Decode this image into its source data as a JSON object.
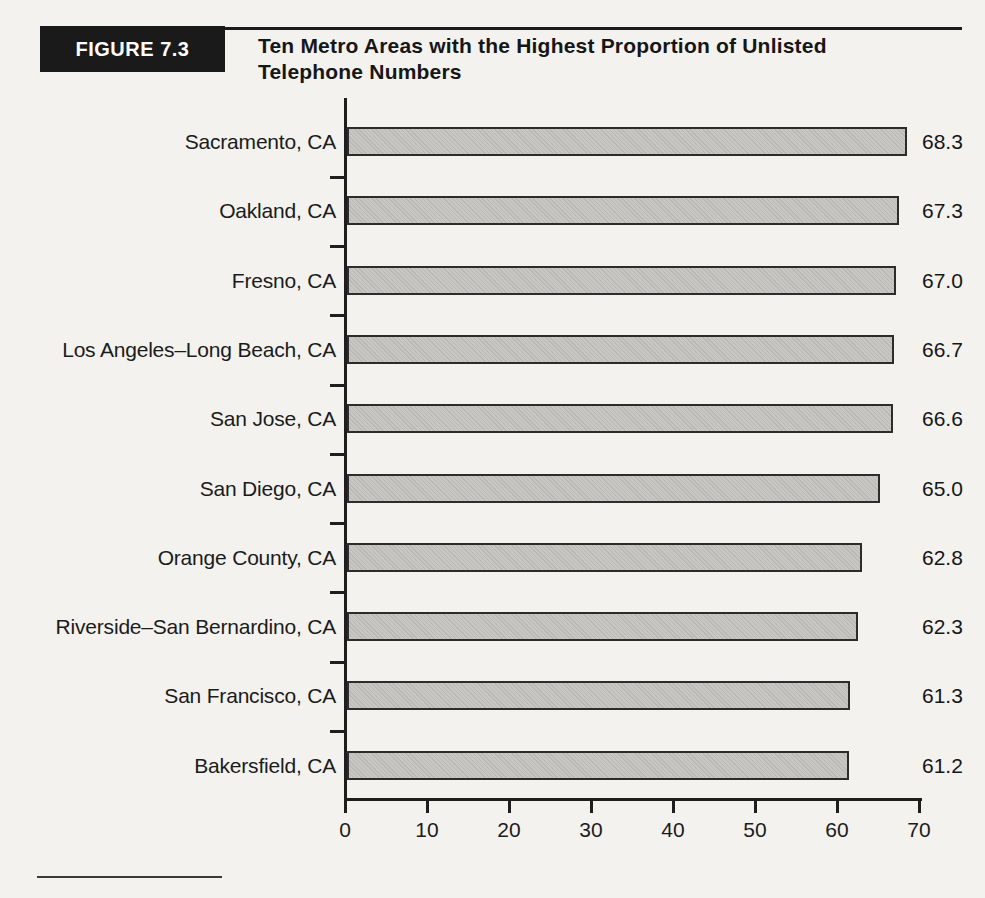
{
  "figure": {
    "label": "FIGURE 7.3",
    "title_line1": "Ten Metro Areas with the Highest Proportion of Unlisted",
    "title_line2": "Telephone Numbers"
  },
  "chart_data": {
    "type": "bar",
    "orientation": "horizontal",
    "title": "Ten Metro Areas with the Highest Proportion of Unlisted Telephone Numbers",
    "categories": [
      "Sacramento, CA",
      "Oakland, CA",
      "Fresno, CA",
      "Los Angeles–Long Beach, CA",
      "San Jose, CA",
      "San Diego, CA",
      "Orange County, CA",
      "Riverside–San Bernardino, CA",
      "San Francisco, CA",
      "Bakersfield, CA"
    ],
    "values": [
      68.3,
      67.3,
      67.0,
      66.7,
      66.6,
      65.0,
      62.8,
      62.3,
      61.3,
      61.2
    ],
    "value_labels": [
      "68.3",
      "67.3",
      "67.0",
      "66.7",
      "66.6",
      "65.0",
      "62.8",
      "62.3",
      "61.3",
      "61.2"
    ],
    "xlabel": "",
    "ylabel": "",
    "xlim": [
      0,
      70
    ],
    "x_ticks": [
      0,
      10,
      20,
      30,
      40,
      50,
      60,
      70
    ],
    "grid": false,
    "legend": "none",
    "value_label_position": "right-of-bar"
  },
  "colors": {
    "page_bg": "#f3f2ef",
    "bar_fill": "#c8c7c4",
    "bar_border": "#2c2c2c",
    "axis": "#1e1e1e",
    "text": "#1b1b1b",
    "figure_box_bg": "#1a1a1a",
    "figure_box_text": "#ffffff"
  }
}
